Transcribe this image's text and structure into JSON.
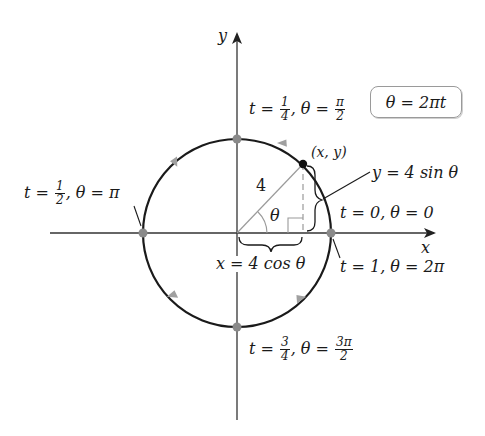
{
  "diagram": {
    "type": "parametric-circle",
    "axes": {
      "x_label": "x",
      "y_label": "y"
    },
    "circle": {
      "radius": 4,
      "radius_label": "4",
      "center": [
        0,
        0
      ],
      "direction": "counterclockwise"
    },
    "formula_box": "θ = 2πt",
    "point_label": "(x, y)",
    "angle_label": "θ",
    "x_expression": "x = 4 cos θ",
    "y_expression": "y = 4 sin θ",
    "key_points": [
      {
        "name": "right",
        "t_text": "t = 0, θ = 0",
        "t": "0",
        "theta": "0"
      },
      {
        "name": "right-end",
        "t_text": "t = 1, θ = 2π",
        "t": "1",
        "theta": "2π"
      },
      {
        "name": "top",
        "t_num": "1",
        "t_den": "4",
        "theta_num": "π",
        "theta_den": "2"
      },
      {
        "name": "left",
        "t_num": "1",
        "t_den": "2",
        "theta": "π"
      },
      {
        "name": "bottom",
        "t_num": "3",
        "t_den": "4",
        "theta_num": "3π",
        "theta_den": "2"
      }
    ],
    "labels": {
      "t": "t",
      "eq": " = ",
      "comma_theta": ", θ = ",
      "pi": "π"
    },
    "colors": {
      "stroke": "#1a1a1a",
      "axis": "#333333",
      "dot": "#8a8a8a",
      "arrow": "#a0a0a0",
      "thin": "#9a9a9a"
    }
  }
}
